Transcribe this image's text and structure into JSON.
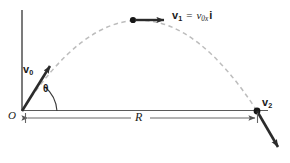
{
  "figure": {
    "name": "projectile-motion-diagram"
  },
  "labels": {
    "origin": "O",
    "range": "R",
    "theta": "θ",
    "v0_name": "v",
    "v0_sub": "0",
    "v1_name": "v",
    "v1_sub": "1",
    "equals": "=",
    "v1_value_name": "v",
    "v1_value_sub": "0x",
    "unit_vector_i": "i",
    "v2_name": "v",
    "v2_sub": "2"
  },
  "colors": {
    "ink": "#1a1a1a",
    "axis": "#555555",
    "trajectory": "#b9b9b9",
    "vector": "#2b2b2b",
    "background": "#ffffff"
  },
  "geometry": {
    "origin": [
      22,
      111
    ],
    "apex": [
      133,
      20
    ],
    "landing": [
      257,
      111
    ],
    "v0_tip": [
      53,
      63
    ],
    "v1_tip": [
      168,
      20
    ],
    "v2_tip": [
      281,
      152
    ],
    "range_line_y": 118
  }
}
